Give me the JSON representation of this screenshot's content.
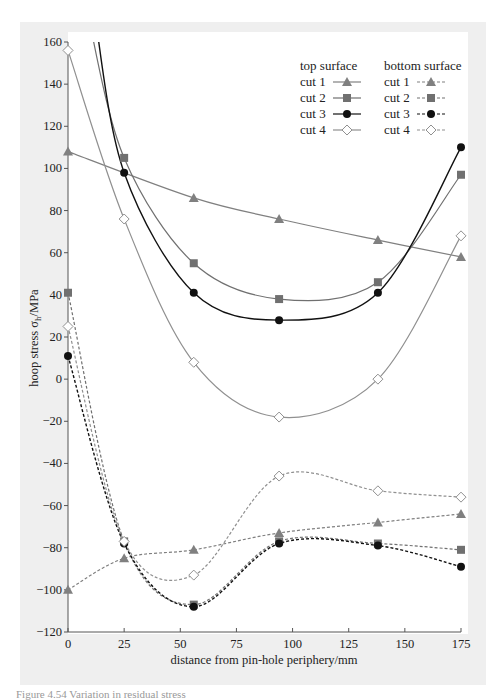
{
  "figure": {
    "caption": "Figure 4.54   Variation in residual stress",
    "legend": {
      "top_heading": "top surface",
      "bottom_heading": "bottom surface",
      "top_items": [
        "cut 1",
        "cut 2",
        "cut 3",
        "cut 4"
      ],
      "bottom_items": [
        "cut 1",
        "cut 2",
        "cut 3",
        "cut 4"
      ]
    }
  },
  "chart_data": {
    "type": "line",
    "title": "",
    "xlabel": "distance from pin-hole periphery/mm",
    "ylabel": "hoop stress σh/MPa",
    "xlim": [
      0,
      175
    ],
    "ylim": [
      -120,
      160
    ],
    "xticks": [
      0,
      25,
      50,
      75,
      100,
      125,
      150,
      175
    ],
    "yticks": [
      -120,
      -100,
      -80,
      -60,
      -40,
      -20,
      0,
      20,
      40,
      60,
      80,
      100,
      120,
      140,
      160
    ],
    "grid": false,
    "legend_position": "upper right",
    "x": [
      0,
      25,
      56,
      94,
      138,
      175
    ],
    "series": [
      {
        "name": "top surface cut 1",
        "surface": "top",
        "line": "solid",
        "marker": "triangle",
        "color": "#808080",
        "values": [
          108,
          null,
          86,
          76,
          66,
          58
        ]
      },
      {
        "name": "top surface cut 2",
        "surface": "top",
        "line": "solid",
        "marker": "square",
        "color": "#707070",
        "values": [
          null,
          105,
          55,
          38,
          46,
          97
        ]
      },
      {
        "name": "top surface cut 3",
        "surface": "top",
        "line": "solid",
        "marker": "circle",
        "color": "#111111",
        "values": [
          null,
          98,
          41,
          28,
          41,
          110
        ]
      },
      {
        "name": "top surface cut 4",
        "surface": "top",
        "line": "solid",
        "marker": "open-diamond",
        "color": "#909090",
        "values": [
          156,
          76,
          8,
          -18,
          0,
          68
        ]
      },
      {
        "name": "bottom surface cut 1",
        "surface": "bottom",
        "line": "dashed",
        "marker": "triangle",
        "color": "#808080",
        "values": [
          -100,
          -85,
          -81,
          -73,
          -68,
          -64
        ]
      },
      {
        "name": "bottom surface cut 2",
        "surface": "bottom",
        "line": "dashed",
        "marker": "square",
        "color": "#707070",
        "values": [
          41,
          -77,
          -107,
          -77,
          -78,
          -81
        ]
      },
      {
        "name": "bottom surface cut 3",
        "surface": "bottom",
        "line": "dashed",
        "marker": "circle",
        "color": "#111111",
        "values": [
          11,
          -78,
          -108,
          -78,
          -79,
          -89
        ]
      },
      {
        "name": "bottom surface cut 4",
        "surface": "bottom",
        "line": "dashed",
        "marker": "open-diamond",
        "color": "#909090",
        "values": [
          25,
          -77,
          -93,
          -46,
          -53,
          -56
        ]
      }
    ]
  }
}
